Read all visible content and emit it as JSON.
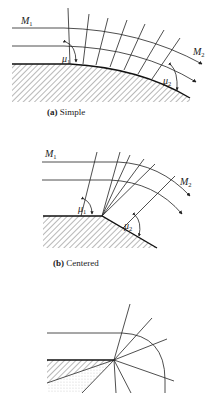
{
  "figure": {
    "panels": [
      {
        "id": "a",
        "caption_letter": "(a)",
        "caption_text": " Simple",
        "labels": {
          "upstream_mach": "M",
          "upstream_sub": "1",
          "downstream_mach": "M",
          "downstream_sub": "2",
          "angle1": "μ",
          "angle1_sub": "1",
          "angle2": "μ",
          "angle2_sub": "2"
        }
      },
      {
        "id": "b",
        "caption_letter": "(b)",
        "caption_text": " Centered",
        "labels": {
          "upstream_mach": "M",
          "upstream_sub": "1",
          "downstream_mach": "M",
          "downstream_sub": "2",
          "angle1": "μ",
          "angle1_sub": "1",
          "angle2": "μ",
          "angle2_sub": "2"
        }
      },
      {
        "id": "c",
        "caption_letter": "",
        "caption_text": "",
        "labels": {}
      }
    ],
    "colors": {
      "ink": "#222222",
      "background": "#ffffff"
    }
  }
}
